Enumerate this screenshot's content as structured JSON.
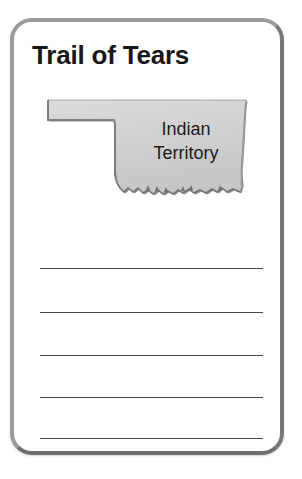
{
  "worksheet": {
    "title": "Trail of Tears",
    "map": {
      "name": "oklahoma-indian-territory-map",
      "label_line_1": "Indian",
      "label_line_2": "Territory",
      "fill_color": "#d2d2d2",
      "outline_color": "#6b6b6b"
    },
    "writing_lines": [
      {
        "id": "line-1",
        "top": 268
      },
      {
        "id": "line-2",
        "top": 312
      },
      {
        "id": "line-3",
        "top": 355
      },
      {
        "id": "line-4",
        "top": 397
      },
      {
        "id": "line-5",
        "top": 438
      }
    ],
    "card": {
      "border_color": "#8d8d8d",
      "background_color": "#ffffff"
    }
  }
}
